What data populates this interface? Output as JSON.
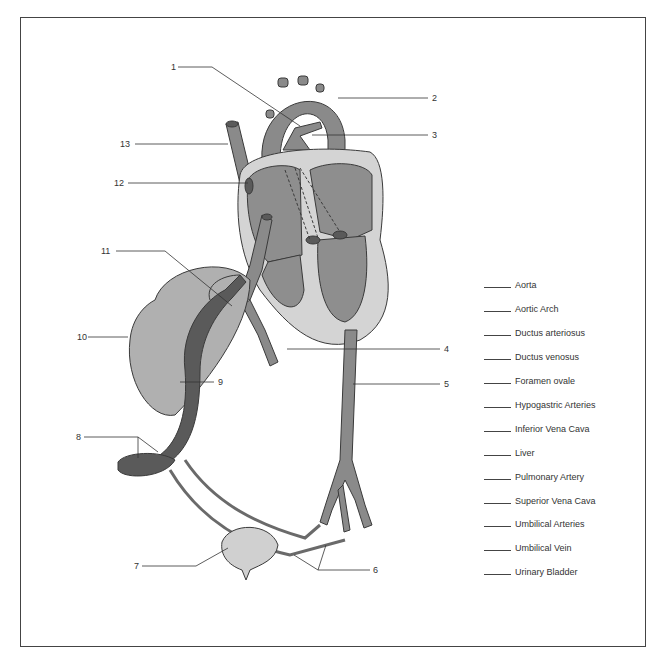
{
  "figure": {
    "colors": {
      "vessel": "#8a8a8a",
      "vein_dark": "#5a5a5a",
      "heart_chamber": "#8e8e8e",
      "heart_wall": "#d4d4d4",
      "liver": "#b0b0b0",
      "bladder": "#d0d0d0",
      "outline": "#3a3a3a"
    }
  },
  "callouts": [
    {
      "n": "1"
    },
    {
      "n": "2"
    },
    {
      "n": "3"
    },
    {
      "n": "4"
    },
    {
      "n": "5"
    },
    {
      "n": "6"
    },
    {
      "n": "7"
    },
    {
      "n": "8"
    },
    {
      "n": "9"
    },
    {
      "n": "10"
    },
    {
      "n": "11"
    },
    {
      "n": "12"
    },
    {
      "n": "13"
    }
  ],
  "answer_key": [
    {
      "blank": "______",
      "term": "Aorta"
    },
    {
      "blank": "______",
      "term": "Aortic Arch"
    },
    {
      "blank": "______",
      "term": "Ductus arteriosus"
    },
    {
      "blank": "______",
      "term": "Ductus venosus"
    },
    {
      "blank": "______",
      "term": "Foramen ovale"
    },
    {
      "blank": "______",
      "term": "Hypogastric Arteries"
    },
    {
      "blank": "______",
      "term": "Inferior Vena Cava"
    },
    {
      "blank": "______",
      "term": "Liver"
    },
    {
      "blank": "______",
      "term": "Pulmonary Artery"
    },
    {
      "blank": "______",
      "term": "Superior Vena Cava"
    },
    {
      "blank": "______",
      "term": "Umbilical Arteries"
    },
    {
      "blank": "______",
      "term": "Umbilical Vein"
    },
    {
      "blank": "______",
      "term": "Urinary Bladder"
    }
  ]
}
